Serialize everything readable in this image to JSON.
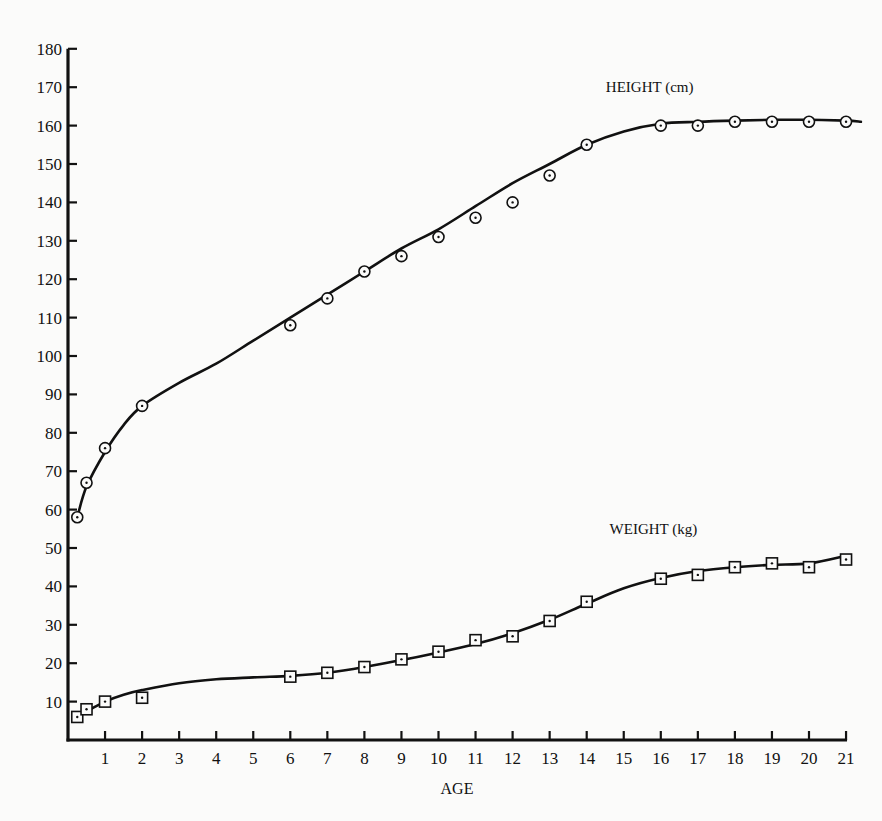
{
  "chart_data": {
    "type": "line",
    "title": "",
    "xlabel": "AGE",
    "ylabel": "",
    "xlim": [
      0,
      21
    ],
    "ylim": [
      0,
      180
    ],
    "grid": false,
    "legend": "inline labels near curves",
    "x_ticks": [
      1,
      2,
      3,
      4,
      5,
      6,
      7,
      8,
      9,
      10,
      11,
      12,
      13,
      14,
      15,
      16,
      17,
      18,
      19,
      20,
      21
    ],
    "y_ticks": [
      10,
      20,
      30,
      40,
      50,
      60,
      70,
      80,
      90,
      100,
      110,
      120,
      130,
      140,
      150,
      160,
      170,
      180
    ],
    "series": [
      {
        "name": "HEIGHT (cm)",
        "marker": "circle-dot",
        "points": [
          {
            "x": 0.25,
            "y": 58
          },
          {
            "x": 0.5,
            "y": 67
          },
          {
            "x": 1,
            "y": 76
          },
          {
            "x": 2,
            "y": 87
          },
          {
            "x": 6,
            "y": 108
          },
          {
            "x": 7,
            "y": 115
          },
          {
            "x": 8,
            "y": 122
          },
          {
            "x": 9,
            "y": 126
          },
          {
            "x": 10,
            "y": 131
          },
          {
            "x": 11,
            "y": 136
          },
          {
            "x": 12,
            "y": 140
          },
          {
            "x": 13,
            "y": 147
          },
          {
            "x": 14,
            "y": 155
          },
          {
            "x": 16,
            "y": 160
          },
          {
            "x": 17,
            "y": 160
          },
          {
            "x": 18,
            "y": 161
          },
          {
            "x": 19,
            "y": 161
          },
          {
            "x": 20,
            "y": 161
          },
          {
            "x": 21,
            "y": 161
          }
        ],
        "curve": [
          [
            0.25,
            58
          ],
          [
            0.5,
            66
          ],
          [
            1,
            75
          ],
          [
            1.5,
            82
          ],
          [
            2,
            87
          ],
          [
            3,
            93
          ],
          [
            4,
            98
          ],
          [
            5,
            104
          ],
          [
            6,
            110
          ],
          [
            7,
            116
          ],
          [
            8,
            122
          ],
          [
            9,
            128
          ],
          [
            10,
            133
          ],
          [
            11,
            139
          ],
          [
            12,
            145
          ],
          [
            13,
            150
          ],
          [
            14,
            155
          ],
          [
            15,
            158.5
          ],
          [
            16,
            160.5
          ],
          [
            17,
            161
          ],
          [
            18,
            161.3
          ],
          [
            19,
            161.5
          ],
          [
            20,
            161.5
          ],
          [
            21,
            161.3
          ],
          [
            21.4,
            161
          ]
        ]
      },
      {
        "name": "WEIGHT (kg)",
        "marker": "square-dot",
        "points": [
          {
            "x": 0.25,
            "y": 6
          },
          {
            "x": 0.5,
            "y": 8
          },
          {
            "x": 1,
            "y": 10
          },
          {
            "x": 2,
            "y": 11
          },
          {
            "x": 6,
            "y": 16.5
          },
          {
            "x": 7,
            "y": 17.5
          },
          {
            "x": 8,
            "y": 19
          },
          {
            "x": 9,
            "y": 21
          },
          {
            "x": 10,
            "y": 23
          },
          {
            "x": 11,
            "y": 26
          },
          {
            "x": 12,
            "y": 27
          },
          {
            "x": 13,
            "y": 31
          },
          {
            "x": 14,
            "y": 36
          },
          {
            "x": 16,
            "y": 42
          },
          {
            "x": 17,
            "y": 43
          },
          {
            "x": 18,
            "y": 45
          },
          {
            "x": 19,
            "y": 46
          },
          {
            "x": 20,
            "y": 45
          },
          {
            "x": 21,
            "y": 47
          }
        ],
        "curve": [
          [
            0.25,
            6.5
          ],
          [
            0.5,
            7.5
          ],
          [
            1,
            10
          ],
          [
            1.5,
            11.8
          ],
          [
            2,
            13
          ],
          [
            3,
            14.8
          ],
          [
            4,
            15.8
          ],
          [
            5,
            16.3
          ],
          [
            6,
            16.7
          ],
          [
            7,
            17.5
          ],
          [
            8,
            19
          ],
          [
            9,
            20.8
          ],
          [
            10,
            22.8
          ],
          [
            11,
            25
          ],
          [
            12,
            27.8
          ],
          [
            13,
            31.3
          ],
          [
            14,
            35.5
          ],
          [
            15,
            39.5
          ],
          [
            16,
            42.2
          ],
          [
            17,
            44
          ],
          [
            18,
            45
          ],
          [
            19,
            45.6
          ],
          [
            20,
            46
          ],
          [
            21,
            48
          ]
        ]
      }
    ],
    "annotations": [
      {
        "text": "HEIGHT (cm)",
        "x": 15.7,
        "y": 170
      },
      {
        "text": "WEIGHT (kg)",
        "x": 15.8,
        "y": 55
      }
    ]
  }
}
